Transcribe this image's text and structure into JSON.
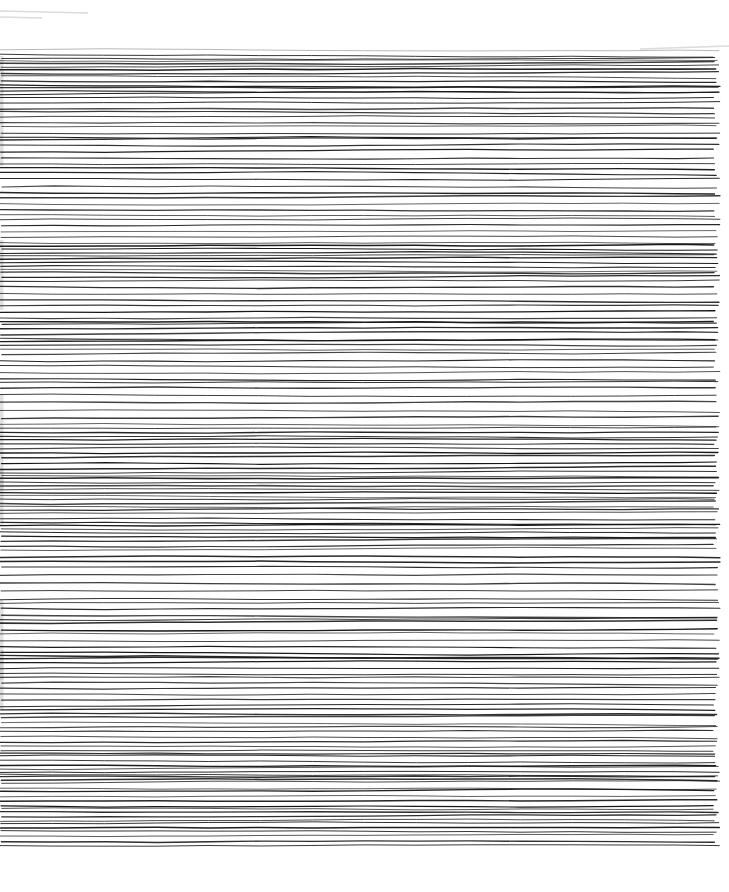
{
  "artwork": {
    "kind": "abstract-line-drawing",
    "description": "Dense hand-drawn irregular horizontal black ink lines on white paper, scanned",
    "canvas": {
      "width": 729,
      "height": 892
    },
    "background_color": "#ffffff",
    "ink_color": "#161616",
    "first_line_color": "#9e9e9e",
    "bounds": {
      "left": 0,
      "right": 720,
      "top": 50,
      "bottom": 848
    },
    "seed": 20240711,
    "line_style": {
      "min_stroke": 0.75,
      "max_stroke": 1.55,
      "min_opacity": 0.78,
      "max_opacity": 1.0,
      "wobble_step": 0.7,
      "wobble_max": 2.8,
      "segment": 52,
      "left_ragged": 4,
      "right_ragged": 7
    },
    "spacing_profile": [
      [
        50,
        3.6
      ],
      [
        110,
        4.2
      ],
      [
        165,
        6.2
      ],
      [
        215,
        4.6
      ],
      [
        260,
        3.6
      ],
      [
        300,
        6.4
      ],
      [
        345,
        5.0
      ],
      [
        395,
        6.8
      ],
      [
        450,
        4.2
      ],
      [
        505,
        3.4
      ],
      [
        555,
        5.8
      ],
      [
        605,
        6.0
      ],
      [
        655,
        4.4
      ],
      [
        700,
        5.2
      ],
      [
        750,
        4.0
      ],
      [
        800,
        3.4
      ],
      [
        848,
        4.2
      ]
    ],
    "spacing_jitter": {
      "min_mult": 0.55,
      "span_mult": 0.9,
      "min_gap": 2.1,
      "max_gap": 12
    },
    "artifacts": {
      "color": "#bdbdbd",
      "top_streaks": [
        {
          "x1": 0,
          "y1": 11,
          "x2": 88,
          "y2": 13
        },
        {
          "x1": 0,
          "y1": 17,
          "x2": 42,
          "y2": 18
        },
        {
          "x1": 640,
          "y1": 49,
          "x2": 729,
          "y2": 46
        }
      ],
      "left_blobs": [
        {
          "y": 56,
          "h": 110
        },
        {
          "y": 240,
          "h": 70
        },
        {
          "y": 395,
          "h": 95
        },
        {
          "y": 470,
          "h": 55
        },
        {
          "y": 600,
          "h": 80
        },
        {
          "y": 650,
          "h": 60
        }
      ]
    }
  }
}
